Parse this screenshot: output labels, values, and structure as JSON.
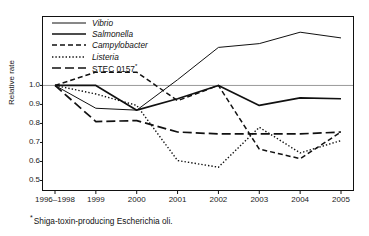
{
  "chart_data": {
    "type": "line",
    "title": "",
    "xlabel": "",
    "ylabel": "Relative rate",
    "categories": [
      "1996–1998",
      "1999",
      "2000",
      "2001",
      "2002",
      "2003",
      "2004",
      "2005"
    ],
    "ylim": [
      0.45,
      1.36
    ],
    "yticks": [
      0.5,
      0.6,
      0.7,
      0.8,
      0.9,
      1.0
    ],
    "ytick_labels": [
      "0.5",
      "0.6",
      "0.7",
      "0.8",
      "0.9",
      "1.0"
    ],
    "grid": false,
    "reference_line": 1.0,
    "legend_position": "top-left",
    "series": [
      {
        "name": "Vibrio",
        "style": "solid",
        "italic": true,
        "values": [
          1.0,
          0.88,
          0.87,
          1.03,
          1.2,
          1.22,
          1.28,
          1.25
        ]
      },
      {
        "name": "Salmonella",
        "style": "solid-thick",
        "italic": true,
        "values": [
          1.0,
          1.0,
          0.87,
          0.93,
          1.0,
          0.895,
          0.935,
          0.93
        ]
      },
      {
        "name": "Campylobacter",
        "style": "dashed-short",
        "italic": true,
        "values": [
          1.0,
          1.07,
          1.07,
          0.92,
          1.0,
          0.665,
          0.615,
          0.755
        ]
      },
      {
        "name": "Listeria",
        "style": "dotted",
        "italic": true,
        "values": [
          1.0,
          0.955,
          0.895,
          0.605,
          0.57,
          0.78,
          0.645,
          0.71
        ]
      },
      {
        "name": "STEC 0157",
        "style": "dash-long",
        "italic": false,
        "superscript": "*",
        "values": [
          1.0,
          0.81,
          0.815,
          0.755,
          0.745,
          0.745,
          0.745,
          0.755
        ]
      }
    ]
  },
  "legend": {
    "items": [
      {
        "label": "Vibrio"
      },
      {
        "label": "Salmonella"
      },
      {
        "label": "Campylobacter"
      },
      {
        "label": "Listeria"
      },
      {
        "label": "STEC 0157",
        "superscript": "*"
      }
    ]
  },
  "footnote": {
    "marker": "*",
    "text": "Shiga-toxin-producing Escherichia oli."
  }
}
